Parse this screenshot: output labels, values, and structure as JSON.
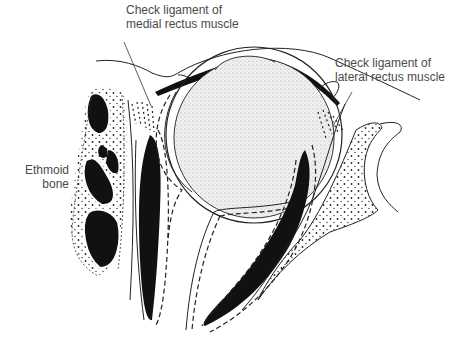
{
  "figure": {
    "colors": {
      "ink": "#111111",
      "label_text": "#4a4a4a",
      "globe_fill": "#e6e6e6",
      "background": "#ffffff"
    }
  },
  "labels": {
    "medial": {
      "line1": "Check ligament of",
      "line2": "medial rectus muscle"
    },
    "lateral": {
      "line1": "Check ligament of",
      "line2": "lateral rectus muscle"
    },
    "ethmoid": {
      "line1": "Ethmoid",
      "line2": "bone"
    }
  }
}
